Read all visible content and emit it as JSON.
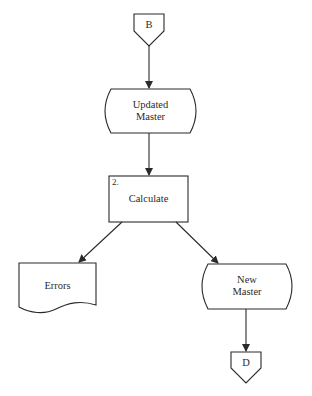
{
  "diagram": {
    "type": "flowchart",
    "line_color": "#2a2a2a",
    "background": "#ffffff",
    "nodes": [
      {
        "id": "B",
        "shape": "off-page-connector",
        "label": "B"
      },
      {
        "id": "updated_master",
        "shape": "stored-data",
        "label": "Updated\nMaster"
      },
      {
        "id": "calculate",
        "shape": "process",
        "step_number": "2.",
        "label": "Calculate"
      },
      {
        "id": "errors",
        "shape": "document",
        "label": "Errors"
      },
      {
        "id": "new_master",
        "shape": "stored-data",
        "label": "New\nMaster"
      },
      {
        "id": "D",
        "shape": "off-page-connector",
        "label": "D"
      }
    ],
    "edges": [
      {
        "from": "B",
        "to": "updated_master"
      },
      {
        "from": "updated_master",
        "to": "calculate"
      },
      {
        "from": "calculate",
        "to": "errors"
      },
      {
        "from": "calculate",
        "to": "new_master"
      },
      {
        "from": "new_master",
        "to": "D"
      }
    ]
  },
  "labels": {
    "B": "B",
    "updated_master": "Updated\nMaster",
    "calculate_step": "2.",
    "calculate": "Calculate",
    "errors": "Errors",
    "new_master": "New\nMaster",
    "D": "D"
  }
}
